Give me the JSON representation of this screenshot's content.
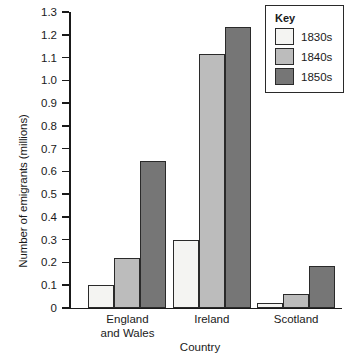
{
  "chart_data": {
    "type": "bar",
    "title": "",
    "xlabel": "Country",
    "ylabel": "Number of emigrants (millions)",
    "categories": [
      "England and Wales",
      "Ireland",
      "Scotland"
    ],
    "series": [
      {
        "name": "1830s",
        "values": [
          0.1,
          0.3,
          0.02
        ],
        "color": "#f4f4f2"
      },
      {
        "name": "1840s",
        "values": [
          0.22,
          1.115,
          0.06
        ],
        "color": "#bcbcbc"
      },
      {
        "name": "1850s",
        "values": [
          0.645,
          1.235,
          0.185
        ],
        "color": "#767676"
      }
    ],
    "ylim": [
      0,
      1.3
    ],
    "ytick_values": [
      0,
      0.1,
      0.2,
      0.3,
      0.4,
      0.5,
      0.6,
      0.7,
      0.8,
      0.9,
      1.0,
      1.1,
      1.2,
      1.3
    ],
    "ytick_labels": [
      "0",
      "0.1",
      "0.2",
      "0.3",
      "0.4",
      "0.5",
      "0.6",
      "0.7",
      "0.8",
      "0.9",
      "1.0",
      "1.1",
      "1.2",
      "1.3"
    ],
    "grid": false,
    "legend": {
      "title": "Key",
      "position": "top-right",
      "entries": [
        "1830s",
        "1840s",
        "1850s"
      ]
    }
  },
  "category_label_lines": [
    [
      "England",
      "and Wales"
    ],
    [
      "Ireland"
    ],
    [
      "Scotland"
    ]
  ]
}
